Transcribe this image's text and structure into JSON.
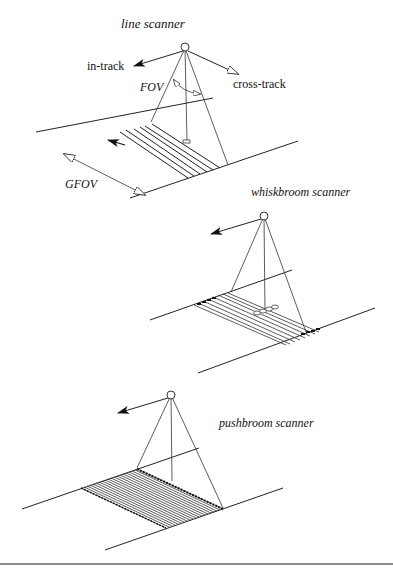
{
  "figure": {
    "panels": [
      {
        "id": "line",
        "title": "line scanner",
        "labels": {
          "in_track": "in-track",
          "cross_track": "cross-track",
          "fov": "FOV",
          "gfov": "GFOV"
        }
      },
      {
        "id": "whiskbroom",
        "title": "whiskbroom scanner"
      },
      {
        "id": "pushbroom",
        "title": "pushbroom scanner"
      }
    ],
    "colors": {
      "line": "#222222",
      "background": "#ffffff",
      "footer_rule": "#666666"
    }
  }
}
